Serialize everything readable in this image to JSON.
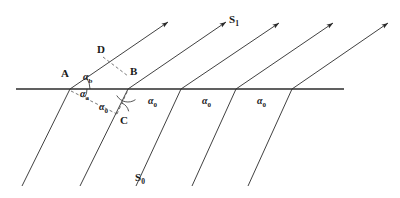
{
  "figure": {
    "stroke_color": "#2b2b2b",
    "dash_color": "#555555",
    "interface": {
      "x1": 16,
      "y1": 89,
      "x2": 344,
      "y2": 89,
      "stroke_width": 1.6
    },
    "rays": [
      {
        "id": "ray-1",
        "below_start": [
          22,
          186
        ],
        "cross": [
          70,
          89
        ],
        "tip": [
          168,
          22
        ]
      },
      {
        "id": "ray-2",
        "below_start": [
          80,
          186
        ],
        "cross": [
          128,
          89
        ],
        "tip": [
          226,
          22
        ]
      },
      {
        "id": "ray-3",
        "below_start": [
          136,
          186
        ],
        "cross": [
          181,
          89
        ],
        "tip": [
          279,
          23
        ]
      },
      {
        "id": "ray-4",
        "below_start": [
          192,
          186
        ],
        "cross": [
          236,
          89
        ],
        "tip": [
          333,
          23
        ]
      },
      {
        "id": "ray-5",
        "below_start": [
          248,
          186
        ],
        "cross": [
          292,
          89
        ],
        "tip": [
          388,
          23
        ]
      }
    ],
    "dashed_segments": [
      {
        "id": "segment-D-B",
        "from": [
          103,
          57
        ],
        "to": [
          128,
          76
        ]
      },
      {
        "id": "segment-A-C",
        "from": [
          71,
          91
        ],
        "to": [
          117,
          114
        ]
      },
      {
        "id": "segment-C-B",
        "from": [
          117,
          114
        ],
        "to": [
          128,
          90
        ]
      }
    ],
    "angle_arcs": [
      {
        "id": "arc-alpha-b",
        "cx": 70,
        "cy": 89,
        "r": 20,
        "a1": -34,
        "a2": 0
      },
      {
        "id": "arc-alpha-a",
        "cx": 70,
        "cy": 89,
        "r": 17,
        "a1": 0,
        "a2": 27
      },
      {
        "id": "arc-alpha-0-at-C",
        "cx": 117,
        "cy": 114,
        "r": 12,
        "a1": -66,
        "a2": -13
      },
      {
        "id": "arc-at-B",
        "cx": 128,
        "cy": 89,
        "r": 13,
        "a1": 55,
        "a2": 150
      }
    ]
  },
  "labels": {
    "points": [
      {
        "id": "point-A",
        "text": "A",
        "x": 61,
        "y": 68
      },
      {
        "id": "point-B",
        "text": "B",
        "x": 130,
        "y": 66
      },
      {
        "id": "point-C",
        "text": "C",
        "x": 120,
        "y": 115
      },
      {
        "id": "point-D",
        "text": "D",
        "x": 97,
        "y": 44
      }
    ],
    "angles": [
      {
        "id": "angle-alpha-b",
        "sym": "α",
        "sub": "b",
        "x": 83,
        "y": 72
      },
      {
        "id": "angle-alpha-a",
        "sym": "α",
        "sub": "a",
        "x": 80,
        "y": 89
      },
      {
        "id": "angle-alpha-0-near-C",
        "sym": "α",
        "sub": "0",
        "x": 99,
        "y": 102
      },
      {
        "id": "angle-alpha-0-first",
        "sym": "α",
        "sub": "0",
        "x": 148,
        "y": 96
      },
      {
        "id": "angle-alpha-0-second",
        "sym": "α",
        "sub": "0",
        "x": 202,
        "y": 96
      },
      {
        "id": "angle-alpha-0-third",
        "sym": "α",
        "sub": "0",
        "x": 257,
        "y": 96
      }
    ],
    "rays": [
      {
        "id": "ray-label-S1",
        "sym": "S",
        "sub": "1",
        "x": 229,
        "y": 14
      },
      {
        "id": "ray-label-S0",
        "sym": "S",
        "sub": "0",
        "x": 135,
        "y": 172
      }
    ]
  }
}
